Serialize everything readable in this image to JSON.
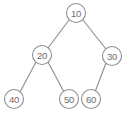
{
  "diagram": {
    "canvas": {
      "width": 129,
      "height": 118
    },
    "style": {
      "background": "#ffffff",
      "node_fill": "#ffffff",
      "node_stroke": "#8f8f8f",
      "edge_stroke": "#8c8c8c",
      "label_color": "#6e6e6e",
      "node_radius": 9.5
    },
    "nodes": [
      {
        "id": "n10",
        "label": "10",
        "cx": 76,
        "cy": 13,
        "r": 9.5,
        "role": "root"
      },
      {
        "id": "n20",
        "label": "20",
        "cx": 42,
        "cy": 55,
        "r": 9.5,
        "role": "left-child-of-10"
      },
      {
        "id": "n30",
        "label": "30",
        "cx": 112,
        "cy": 56,
        "r": 9.5,
        "role": "right-child-of-10"
      },
      {
        "id": "n40",
        "label": "40",
        "cx": 14,
        "cy": 99,
        "r": 9.5,
        "role": "left-child-of-20"
      },
      {
        "id": "n50",
        "label": "50",
        "cx": 69,
        "cy": 99,
        "r": 9.5,
        "role": "right-child-of-20"
      },
      {
        "id": "n60",
        "label": "60",
        "cx": 91,
        "cy": 99,
        "r": 9.5,
        "role": "left-child-of-30"
      }
    ],
    "edges": [
      {
        "id": "e10-20",
        "from": "n10",
        "to": "n20",
        "x1": 69,
        "y1": 20,
        "x2": 48,
        "y2": 48
      },
      {
        "id": "e10-30",
        "from": "n10",
        "to": "n30",
        "x1": 83,
        "y1": 20,
        "x2": 106,
        "y2": 49
      },
      {
        "id": "e20-40",
        "from": "n20",
        "to": "n40",
        "x1": 36,
        "y1": 62,
        "x2": 20,
        "y2": 92
      },
      {
        "id": "e20-50",
        "from": "n20",
        "to": "n50",
        "x1": 48,
        "y1": 62,
        "x2": 64,
        "y2": 92
      },
      {
        "id": "e30-60",
        "from": "n30",
        "to": "n60",
        "x1": 106,
        "y1": 63,
        "x2": 95,
        "y2": 92
      }
    ]
  }
}
